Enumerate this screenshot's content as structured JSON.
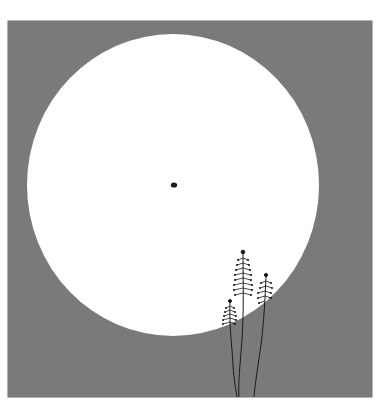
{
  "artwork": {
    "description": "Minimalist illustration: large white circle (moon/sun) on gray square, small dark dot at circle center, three thin plant stalks with fern-like seed heads rising from bottom right",
    "colors": {
      "page_background": "#ffffff",
      "square_fill": "#7a7a7a",
      "circle_fill": "#ffffff",
      "ink": "#1a1a1a"
    },
    "elements": [
      "gray-square",
      "white-circle",
      "center-dot",
      "plant-stalk-left",
      "plant-stalk-middle",
      "plant-stalk-right"
    ]
  }
}
